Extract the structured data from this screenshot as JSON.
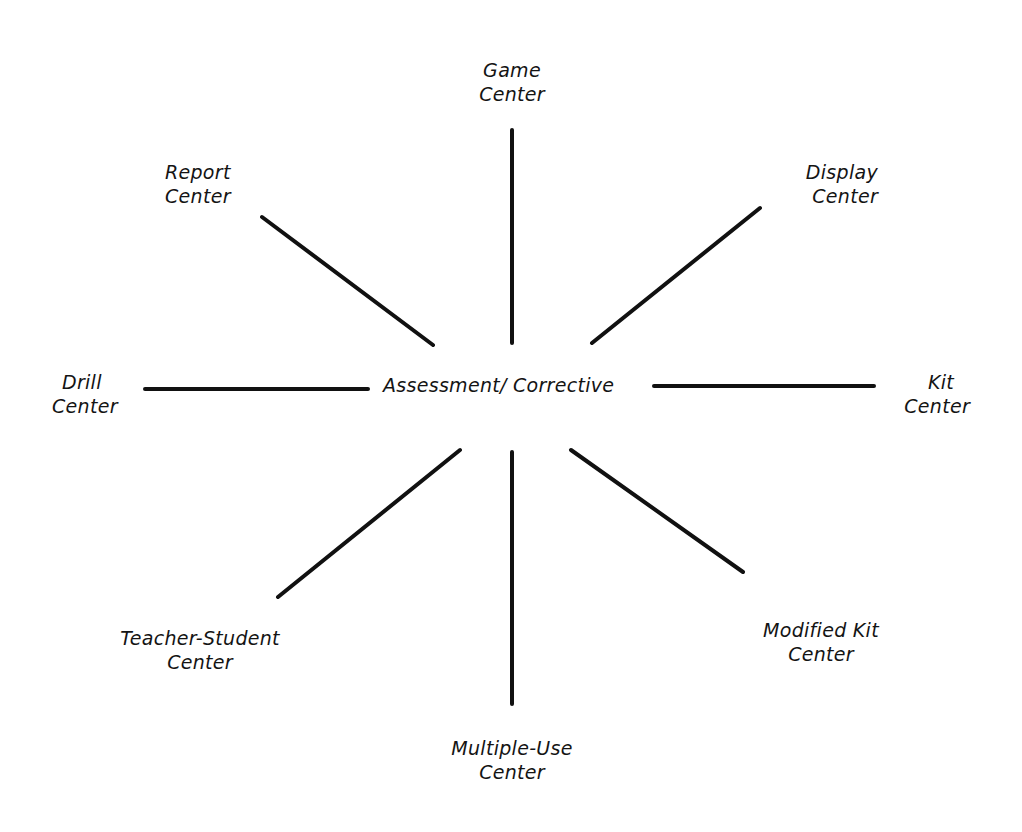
{
  "diagram": {
    "type": "hub-and-spoke",
    "hub": {
      "label": "Assessment/ Corrective"
    },
    "nodes": [
      {
        "id": "game",
        "line1": "Game",
        "line2": "Center",
        "direction": "top"
      },
      {
        "id": "display",
        "line1": "Display",
        "line2": "Center",
        "direction": "top-right"
      },
      {
        "id": "kit",
        "line1": "Kit",
        "line2": "Center",
        "direction": "right"
      },
      {
        "id": "modified-kit",
        "line1": "Modified Kit",
        "line2": "Center",
        "direction": "bottom-right"
      },
      {
        "id": "multiple-use",
        "line1": "Multiple-Use",
        "line2": "Center",
        "direction": "bottom"
      },
      {
        "id": "teacher-student",
        "line1": "Teacher-Student",
        "line2": "Center",
        "direction": "bottom-left"
      },
      {
        "id": "drill",
        "line1": "Drill",
        "line2": "Center",
        "direction": "left"
      },
      {
        "id": "report",
        "line1": "Report",
        "line2": "Center",
        "direction": "top-left"
      }
    ],
    "line_color": "#111111"
  }
}
